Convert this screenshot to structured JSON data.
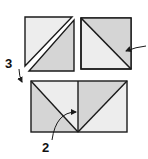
{
  "diagram": {
    "colors": {
      "light": "#ededed",
      "dark": "#d5d5d5",
      "outline": "#1a1a1a",
      "background": "#ffffff"
    },
    "pieces": [
      {
        "id": "top-left-square",
        "diagonal": "bottom-left to top-right",
        "light_triangle": "upper-left",
        "dark_triangle": "lower-right",
        "state": "separated"
      },
      {
        "id": "top-right-square",
        "diagonal": "top-left to bottom-right",
        "light_triangle": "lower-left",
        "dark_triangle": "upper-right",
        "state": "joined"
      },
      {
        "id": "bottom-left-half",
        "diagonal": "top-left to bottom-right",
        "light_triangle": "upper-right",
        "dark_triangle": "lower-left"
      },
      {
        "id": "bottom-right-half",
        "diagonal": "bottom-left to top-right",
        "light_triangle": "lower-right",
        "dark_triangle": "upper-left"
      }
    ],
    "labels": [
      {
        "id": "step-3",
        "text": "3"
      },
      {
        "id": "step-2",
        "text": "2"
      }
    ]
  }
}
